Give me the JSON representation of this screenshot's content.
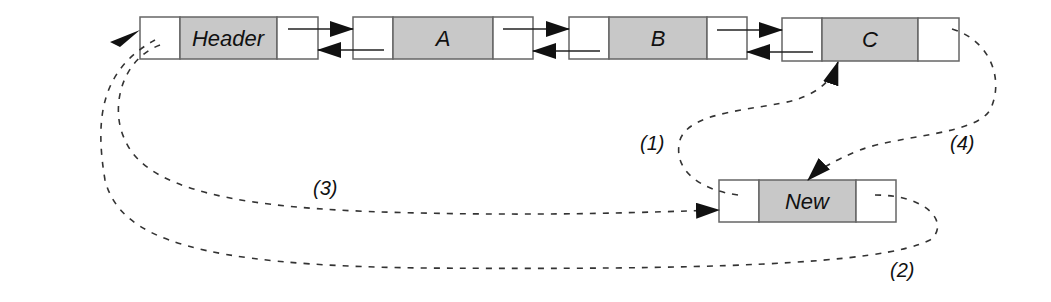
{
  "diagram": {
    "nodes": [
      {
        "id": "header",
        "label": "Header"
      },
      {
        "id": "a",
        "label": "A"
      },
      {
        "id": "b",
        "label": "B"
      },
      {
        "id": "c",
        "label": "C"
      },
      {
        "id": "new",
        "label": "New"
      }
    ],
    "steps": [
      {
        "id": "step1",
        "label": "(1)",
        "description": "New.prev -> C"
      },
      {
        "id": "step2",
        "label": "(2)",
        "description": "New.next -> Header"
      },
      {
        "id": "step3",
        "label": "(3)",
        "description": "Header.prev -> New"
      },
      {
        "id": "step4",
        "label": "(4)",
        "description": "C.next -> New"
      }
    ],
    "colors": {
      "data_cell": "#c8c8c8",
      "pointer_cell": "#ffffff",
      "border": "#666666",
      "line": "#222222"
    }
  }
}
